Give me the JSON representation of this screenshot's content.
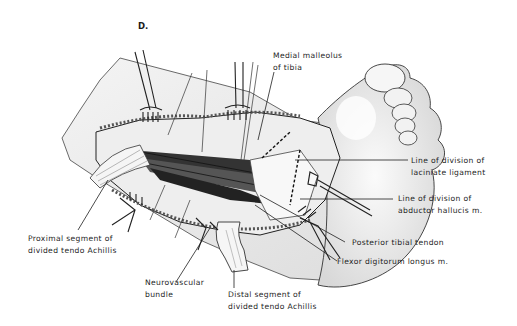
{
  "figure": {
    "panel_letter": "D.",
    "labels": {
      "medial_malleolus": [
        "Medial malleolus",
        "of tibia"
      ],
      "laciniate_ligament": [
        "Line of division of",
        "laciniate ligament"
      ],
      "abductor_hallucis": [
        "Line of division of",
        "abductor hallucis m."
      ],
      "posterior_tibial_tendon": [
        "Posterior tibial tendon"
      ],
      "flexor_digitorum_longus": [
        "Flexor digitorum longus m."
      ],
      "proximal_tendo_achillis": [
        "Proximal segment of",
        "divided tendo Achillis"
      ],
      "neurovascular_bundle": [
        "Neurovascular",
        "bundle"
      ],
      "distal_tendo_achillis": [
        "Distal segment of",
        "divided tendo Achillis"
      ]
    },
    "colors": {
      "ink": "#1e1e1e",
      "skin_shade": "#e4e4e4",
      "skin_light": "#f3f3f3",
      "background": "#ffffff"
    }
  }
}
